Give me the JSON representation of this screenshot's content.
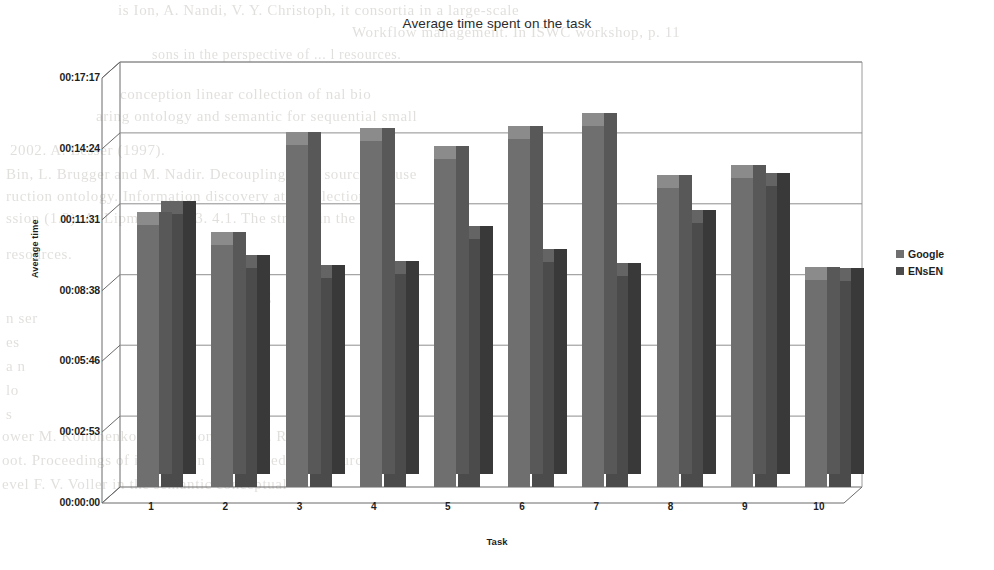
{
  "chart_data": {
    "type": "bar",
    "title": "Average time spent on the task",
    "xlabel": "Task",
    "ylabel": "Average time",
    "categories": [
      "1",
      "2",
      "3",
      "4",
      "5",
      "6",
      "7",
      "8",
      "9",
      "10"
    ],
    "ytick_labels": [
      "00:00:00",
      "00:02:53",
      "00:05:46",
      "00:08:38",
      "00:11:31",
      "00:14:24",
      "00:17:17"
    ],
    "ytick_seconds": [
      0,
      173,
      346,
      518,
      691,
      864,
      1037
    ],
    "ylim": [
      0,
      1037
    ],
    "grid": true,
    "legend_position": "right",
    "series": [
      {
        "name": "Google",
        "color": "#6f6f6f",
        "values": [
          "00:10:40",
          "00:09:50",
          "00:13:55",
          "00:14:05",
          "00:13:20",
          "00:14:10",
          "00:14:40",
          "00:12:10",
          "00:12:35",
          "00:08:25"
        ],
        "values_seconds": [
          640,
          590,
          835,
          845,
          800,
          850,
          880,
          730,
          755,
          505
        ]
      },
      {
        "name": "ENsEN",
        "color": "#4b4b4b",
        "values": [
          "00:11:05",
          "00:08:55",
          "00:08:30",
          "00:08:40",
          "00:10:05",
          "00:09:10",
          "00:08:35",
          "00:10:45",
          "00:12:15",
          "00:08:22"
        ],
        "values_seconds": [
          665,
          535,
          510,
          520,
          605,
          550,
          515,
          645,
          735,
          502
        ]
      }
    ]
  },
  "page_bleed": {
    "lines": [
      {
        "text": "is Ion, A. Nandi, V. Y. Christoph,  it consortia  in a large-scale",
        "x": 118,
        "y": 2,
        "size": 15
      },
      {
        "text": "Workflow  management.  In  ISWC  workshop,  p. 11",
        "x": 352,
        "y": 24,
        "size": 15
      },
      {
        "text": "sons  in the perspective of ... l  resources.",
        "x": 152,
        "y": 47,
        "size": 14
      },
      {
        "text": "conception  linear collection  of   nal  bio",
        "x": 120,
        "y": 86,
        "size": 15
      },
      {
        "text": "aring   ontology and  semantic  for  sequential  small",
        "x": 96,
        "y": 108,
        "size": 15
      },
      {
        "text": "2002. A. Lesser  (1997).",
        "x": 10,
        "y": 142,
        "size": 15
      },
      {
        "text": "Bin, L. Brugger  and  M. Nadir.  Decoupling  such  sources  in  use",
        "x": 6,
        "y": 166,
        "size": 15
      },
      {
        "text": "ruction ontology.  Information  discovery  at a collection  of",
        "x": 6,
        "y": 188,
        "size": 15
      },
      {
        "text": "ssion (1.2). A. Lipmann. 2013. 4.1. The stream  in  the  bio",
        "x": 6,
        "y": 210,
        "size": 15
      },
      {
        "text": "resources.",
        "x": 6,
        "y": 246,
        "size": 15
      },
      {
        "text": "Prolog",
        "x": 228,
        "y": 288,
        "size": 15
      },
      {
        "text": "n   ser",
        "x": 6,
        "y": 310,
        "size": 15
      },
      {
        "text": "es",
        "x": 6,
        "y": 334,
        "size": 15
      },
      {
        "text": "a   n",
        "x": 6,
        "y": 358,
        "size": 15
      },
      {
        "text": "lo",
        "x": 6,
        "y": 382,
        "size": 15
      },
      {
        "text": "s",
        "x": 6,
        "y": 406,
        "size": 15
      },
      {
        "text": "ower M. Kononenko.  Extraction  for   J.   R.  R.   A",
        "x": 2,
        "y": 428,
        "size": 15
      },
      {
        "text": "oot.  Proceedings of  integration  with  embedded  resources",
        "x": 2,
        "y": 452,
        "size": 15
      },
      {
        "text": "evel  F. V. Voller  in  the  semantic  conceptual",
        "x": 2,
        "y": 476,
        "size": 15
      }
    ]
  },
  "legend": {
    "items": [
      {
        "label": "Google",
        "swatch": "#6f6f6f"
      },
      {
        "label": "ENsEN",
        "swatch": "#4b4b4b"
      }
    ]
  }
}
